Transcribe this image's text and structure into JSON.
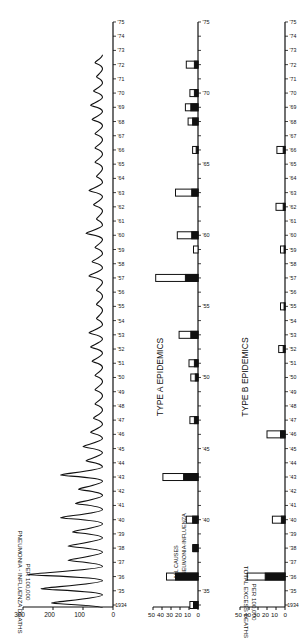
{
  "figure": {
    "orientation": "rotated-90-ccw",
    "background": "#ffffff",
    "ink": "#111111"
  },
  "chart_data": [
    {
      "type": "line",
      "panel": "top",
      "title": "",
      "xlabel": "",
      "ylabel": "PNEUMONIA - INFLUENZA DEATHS",
      "ylabel2": "PER 100,000",
      "ylim": [
        0,
        300
      ],
      "yticks": [
        0,
        100,
        200,
        300
      ],
      "xticks": [
        "1934",
        "'35",
        "'36",
        "'37",
        "'38",
        "'39",
        "'40",
        "'41",
        "'42",
        "'43",
        "'44",
        "'45",
        "'46",
        "'47",
        "'48",
        "'49",
        "'50",
        "'51",
        "'52",
        "'53",
        "'54",
        "'55",
        "'56",
        "'57",
        "'58",
        "'59",
        "'60",
        "'61",
        "'62",
        "'63",
        "'64",
        "'65",
        "'66",
        "'67",
        "'68",
        "'69",
        "'70",
        "'71",
        "'72",
        "'73",
        "'74",
        "'75"
      ],
      "series": [
        {
          "name": "Pneumonia-Influenza deaths (monthly)",
          "annual_peaks": [
            {
              "year": 1934,
              "value": 205
            },
            {
              "year": 1935,
              "value": 240
            },
            {
              "year": 1936,
              "value": 285
            },
            {
              "year": 1937,
              "value": 150
            },
            {
              "year": 1938,
              "value": 150
            },
            {
              "year": 1939,
              "value": 135
            },
            {
              "year": 1940,
              "value": 175
            },
            {
              "year": 1941,
              "value": 125
            },
            {
              "year": 1942,
              "value": 115
            },
            {
              "year": 1943,
              "value": 175
            },
            {
              "year": 1944,
              "value": 90
            },
            {
              "year": 1945,
              "value": 100
            },
            {
              "year": 1946,
              "value": 75
            },
            {
              "year": 1947,
              "value": 65
            },
            {
              "year": 1948,
              "value": 60
            },
            {
              "year": 1949,
              "value": 60
            },
            {
              "year": 1950,
              "value": 60
            },
            {
              "year": 1951,
              "value": 70
            },
            {
              "year": 1952,
              "value": 75
            },
            {
              "year": 1953,
              "value": 80
            },
            {
              "year": 1954,
              "value": 55
            },
            {
              "year": 1955,
              "value": 55
            },
            {
              "year": 1956,
              "value": 55
            },
            {
              "year": 1957,
              "value": 80
            },
            {
              "year": 1958,
              "value": 70
            },
            {
              "year": 1959,
              "value": 60
            },
            {
              "year": 1960,
              "value": 90
            },
            {
              "year": 1961,
              "value": 55
            },
            {
              "year": 1962,
              "value": 65
            },
            {
              "year": 1963,
              "value": 80
            },
            {
              "year": 1964,
              "value": 55
            },
            {
              "year": 1965,
              "value": 60
            },
            {
              "year": 1966,
              "value": 60
            },
            {
              "year": 1967,
              "value": 60
            },
            {
              "year": 1968,
              "value": 70
            },
            {
              "year": 1969,
              "value": 75
            },
            {
              "year": 1970,
              "value": 65
            },
            {
              "year": 1971,
              "value": 55
            },
            {
              "year": 1972,
              "value": 60
            }
          ],
          "trough": 35
        }
      ]
    },
    {
      "type": "bar",
      "panel": "middle",
      "title": "TYPE A EPIDEMICS",
      "ylabel": "",
      "ylim": [
        0,
        50
      ],
      "yticks": [
        0,
        10,
        20,
        30,
        40,
        50
      ],
      "xtick_labels": [
        "'35",
        "'40",
        "'45",
        "'50",
        "'55",
        "'60",
        "'65",
        "'70",
        "'75"
      ],
      "legend": [
        "ALL CAUSES",
        "PNEUMONIA-INFLUENZA"
      ],
      "legend_position": "inside, near 1936 bar",
      "categories": [
        1934,
        1936,
        1938,
        1940,
        1943,
        1947,
        1950,
        1951,
        1953,
        1957,
        1959,
        1960,
        1963,
        1966,
        1968,
        1969,
        1970,
        1972
      ],
      "series": [
        {
          "name": "ALL CAUSES",
          "fill": "white",
          "values": [
            9,
            35,
            6,
            13,
            39,
            9,
            8,
            10,
            21,
            47,
            5,
            23,
            25,
            6,
            11,
            14,
            9,
            13
          ]
        },
        {
          "name": "PNEUMONIA-INFLUENZA",
          "fill": "black",
          "values": [
            5,
            25,
            5,
            6,
            16,
            4,
            3,
            4,
            8,
            14,
            0,
            7,
            7,
            2,
            6,
            8,
            4,
            4
          ]
        }
      ]
    },
    {
      "type": "bar",
      "panel": "bottom",
      "title": "TYPE B EPIDEMICS",
      "ylabel": "TOTAL EXCESS DEATHS",
      "ylabel2": "PER 100,000",
      "ylim": [
        0,
        50
      ],
      "yticks": [
        0,
        10,
        20,
        30,
        40,
        50
      ],
      "xticks": [
        "1934",
        "'35",
        "'36",
        "'37",
        "'38",
        "'39",
        "'40",
        "'41",
        "'42",
        "'43",
        "'44",
        "'45",
        "'46",
        "'47",
        "'48",
        "'49",
        "'50",
        "'51",
        "'52",
        "'53",
        "'54",
        "'55",
        "'56",
        "'57",
        "'58",
        "'59",
        "'60",
        "'61",
        "'62",
        "'63",
        "'64",
        "'65",
        "'66",
        "'67",
        "'68",
        "'69",
        "'70",
        "'71",
        "'72",
        "'73",
        "'74",
        "'75"
      ],
      "categories": [
        1936,
        1940,
        1946,
        1952,
        1955,
        1959,
        1962,
        1966
      ],
      "series": [
        {
          "name": "ALL CAUSES",
          "fill": "white",
          "values": [
            42,
            14,
            20,
            7,
            5,
            5,
            10,
            9
          ]
        },
        {
          "name": "PNEUMONIA-INFLUENZA",
          "fill": "black",
          "values": [
            22,
            4,
            5,
            2,
            1,
            1,
            2,
            2
          ]
        }
      ]
    }
  ],
  "labels": {
    "top_ylabel": "PNEUMONIA - INFLUENZA DEATHS",
    "top_ylabel2": "PER 100,000",
    "bottom_ylabel": "TOTAL EXCESS DEATHS",
    "bottom_ylabel2": "PER 100,000",
    "type_a": "TYPE A EPIDEMICS",
    "type_b": "TYPE B EPIDEMICS",
    "legend_all": "ALL CAUSES",
    "legend_pi": "PNEUMONIA-INFLUENZA"
  }
}
